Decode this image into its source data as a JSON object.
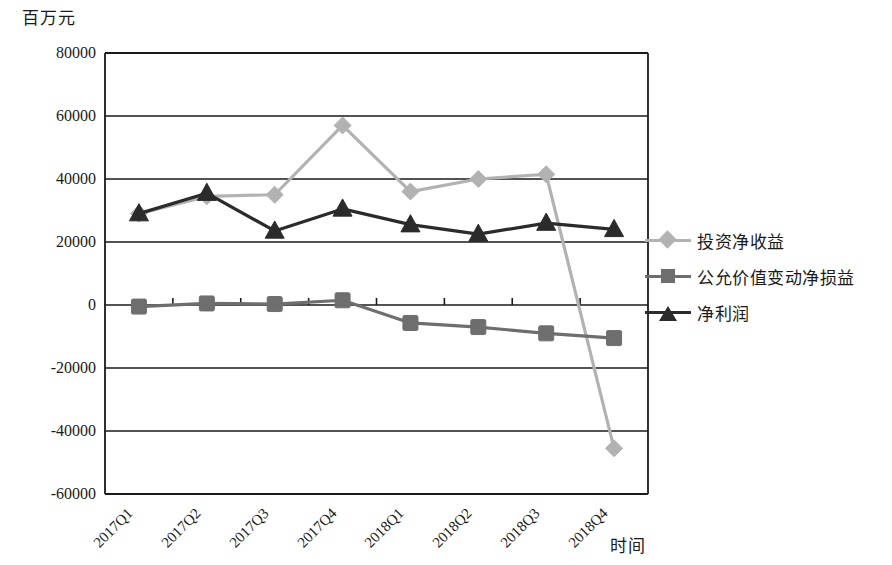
{
  "chart_data": {
    "type": "line",
    "title": "",
    "ylabel": "百万元",
    "xlabel": "时间",
    "categories": [
      "2017Q1",
      "2017Q2",
      "2017Q3",
      "2017Q4",
      "2018Q1",
      "2018Q2",
      "2018Q3",
      "2018Q4"
    ],
    "ylim": [
      -60000,
      80000
    ],
    "ytick_labels": [
      "80000",
      "60000",
      "40000",
      "20000",
      "0",
      "-20000",
      "-40000",
      "-60000"
    ],
    "yticks": [
      80000,
      60000,
      40000,
      20000,
      0,
      -20000,
      -40000,
      -60000
    ],
    "grid": true,
    "legend_position": "right",
    "series": [
      {
        "name": "投资净收益",
        "marker": "diamond",
        "color": "#b2b2b2",
        "values": [
          29000,
          34500,
          35000,
          57000,
          36000,
          40000,
          41500,
          -45500
        ]
      },
      {
        "name": "公允价值变动净损益",
        "marker": "square",
        "color": "#6e6e6e",
        "values": [
          -500,
          500,
          300,
          1500,
          -5700,
          -7000,
          -9000,
          -10500
        ]
      },
      {
        "name": "净利润",
        "marker": "triangle",
        "color": "#2b2b2b",
        "values": [
          29000,
          35500,
          23500,
          30500,
          25500,
          22500,
          26000,
          24000
        ]
      }
    ]
  },
  "legend": {
    "items": [
      {
        "label": "投资净收益",
        "marker": "diamond",
        "color": "#b2b2b2"
      },
      {
        "label": "公允价值变动净损益",
        "marker": "square",
        "color": "#6e6e6e"
      },
      {
        "label": "净利润",
        "marker": "triangle",
        "color": "#2b2b2b"
      }
    ]
  }
}
